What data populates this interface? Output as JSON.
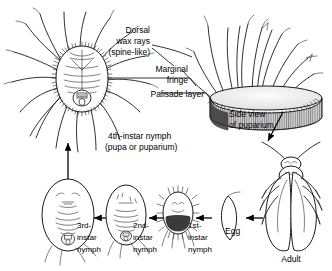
{
  "figure": {
    "ink_color": "#1a1a1a",
    "background_color": "#ffffff"
  },
  "anatomy_labels": {
    "dorsal_wax_rays_line1": "Dorsal",
    "dorsal_wax_rays_line2": "wax rays",
    "dorsal_wax_rays_line3": "(spine-like)",
    "marginal_fringe_line1": "Marginal",
    "marginal_fringe_line2": "fringe",
    "palisade_layer": "Palisade layer"
  },
  "specimens": {
    "fourth_instar_line1": "4th-instar nymph",
    "fourth_instar_line2": "(pupa or puparium)",
    "side_view_line1": "Side view",
    "side_view_line2": "of puparium"
  },
  "life_cycle": {
    "stages": [
      {
        "name": "third-instar-nymph",
        "line1": "3rd-",
        "line2": "instar",
        "line3": "nymph"
      },
      {
        "name": "second-instar-nymph",
        "line1": "2nd-",
        "line2": "instar",
        "line3": "nymph"
      },
      {
        "name": "first-instar-nymph",
        "line1": "1st-",
        "line2": "instar",
        "line3": "nymph"
      },
      {
        "name": "egg",
        "line1": "Egg",
        "line2": "",
        "line3": ""
      },
      {
        "name": "adult",
        "line1": "Adult",
        "line2": "",
        "line3": ""
      }
    ]
  }
}
